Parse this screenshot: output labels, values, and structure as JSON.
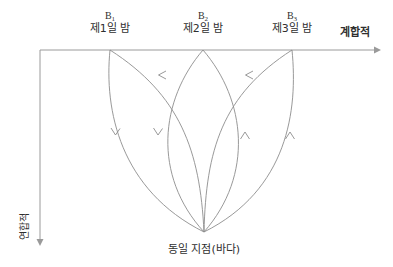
{
  "figure": {
    "background_color": "#ffffff",
    "line_color": "#8d8d8d",
    "axis_color": "#9a9a9a",
    "text_color": "#2f2f2f"
  },
  "axes": {
    "x_axis_label": "계합적",
    "y_axis_label": "연합적",
    "origin": {
      "x": 40,
      "y": 50
    },
    "x_end": {
      "x": 378,
      "y": 50
    },
    "y_end": {
      "x": 40,
      "y": 243
    }
  },
  "nodes": [
    {
      "symbol": "B",
      "subscript": "1",
      "label": "제1일 밤",
      "x": 110,
      "y": 50
    },
    {
      "symbol": "B",
      "subscript": "2",
      "label": "제2일 밤",
      "x": 203,
      "y": 50
    },
    {
      "symbol": "B",
      "subscript": "3",
      "label": "제3일 밤",
      "x": 292,
      "y": 50
    }
  ],
  "convergence_point": {
    "label": "동일 지점(바다)",
    "x": 204,
    "y": 232
  },
  "arrow_markers": [
    {
      "name": "arrow-down-left-curve",
      "x": 115,
      "y": 133,
      "direction": "down"
    },
    {
      "name": "arrow-down-inner-left-curve",
      "x": 158,
      "y": 133,
      "direction": "down"
    },
    {
      "name": "arrow-up-inner-right-curve",
      "x": 245,
      "y": 133,
      "direction": "up"
    },
    {
      "name": "arrow-up-right-curve",
      "x": 290,
      "y": 133,
      "direction": "up"
    },
    {
      "name": "arrow-left-b2-to-b1",
      "x": 160,
      "y": 75,
      "direction": "left"
    },
    {
      "name": "arrow-left-b3-to-b2",
      "x": 247,
      "y": 75,
      "direction": "left"
    }
  ]
}
